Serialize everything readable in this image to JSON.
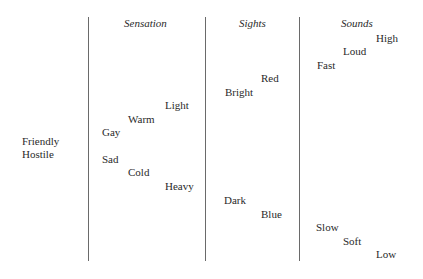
{
  "left_labels": [
    "Friendly",
    "Hostile"
  ],
  "columns": [
    {
      "header": "Sensation",
      "words": [
        "Light",
        "Warm",
        "Gay",
        "Sad",
        "Cold",
        "Heavy"
      ]
    },
    {
      "header": "Sights",
      "words": [
        "Red",
        "Bright",
        "Dark",
        "Blue"
      ]
    },
    {
      "header": "Sounds",
      "words": [
        "High",
        "Loud",
        "Fast",
        "Slow",
        "Soft",
        "Low"
      ]
    }
  ]
}
